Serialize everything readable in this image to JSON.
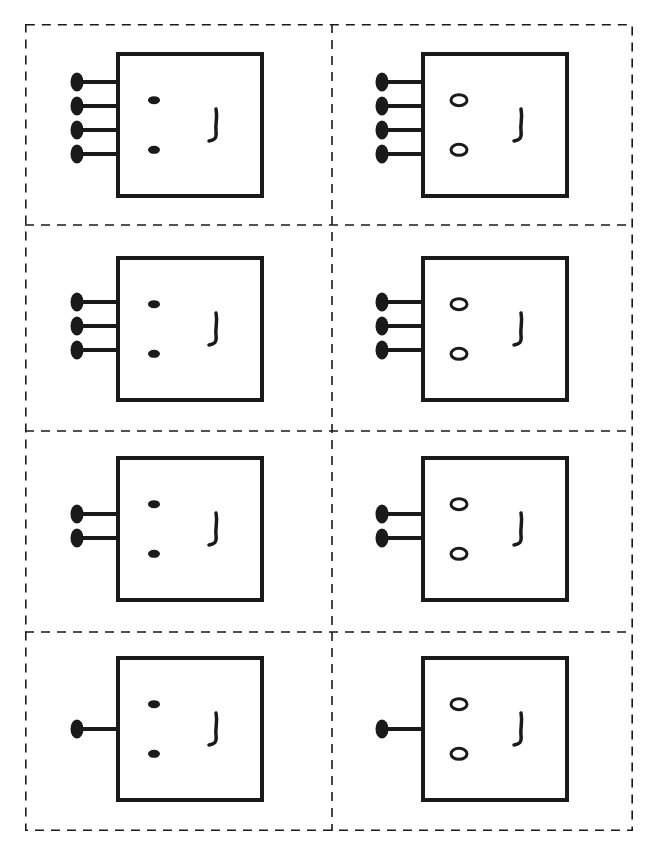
{
  "worksheet": {
    "title": "",
    "layout": {
      "rows": 4,
      "columns": 2
    },
    "line_color": "#1a1a1a",
    "background": "#ffffff",
    "cut_line_style": "dashed",
    "cards": [
      {
        "row": 1,
        "col": 1,
        "pins": 4,
        "eyes": "filled-dots",
        "nose": "ʃ"
      },
      {
        "row": 1,
        "col": 2,
        "pins": 4,
        "eyes": "hollow-rings",
        "nose": "ʃ"
      },
      {
        "row": 2,
        "col": 1,
        "pins": 3,
        "eyes": "filled-dots",
        "nose": "ʃ"
      },
      {
        "row": 2,
        "col": 2,
        "pins": 3,
        "eyes": "hollow-rings",
        "nose": "ʃ"
      },
      {
        "row": 3,
        "col": 1,
        "pins": 2,
        "eyes": "filled-dots",
        "nose": "ʃ"
      },
      {
        "row": 3,
        "col": 2,
        "pins": 2,
        "eyes": "hollow-rings",
        "nose": "ʃ"
      },
      {
        "row": 4,
        "col": 1,
        "pins": 1,
        "eyes": "filled-dots",
        "nose": "ʃ"
      },
      {
        "row": 4,
        "col": 2,
        "pins": 1,
        "eyes": "hollow-rings",
        "nose": "ʃ"
      }
    ]
  }
}
